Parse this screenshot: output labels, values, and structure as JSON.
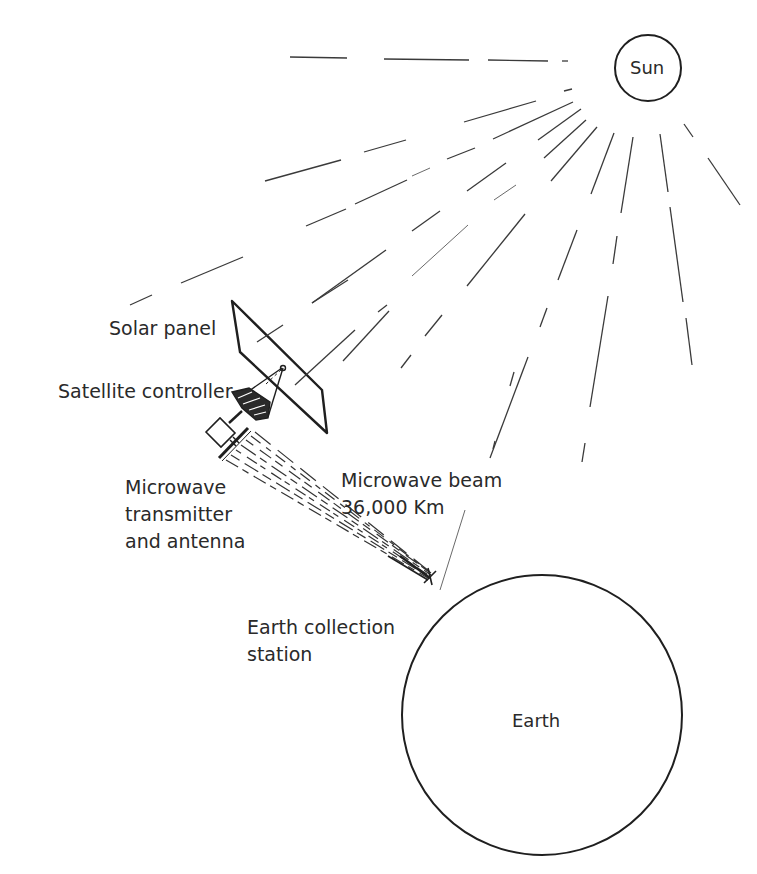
{
  "diagram": {
    "labels": {
      "sun": "Sun",
      "solar_panel": "Solar panel",
      "satellite_controller": "Satellite controller",
      "transmitter_line1": "Microwave",
      "transmitter_line2": "transmitter",
      "transmitter_line3": "and antenna",
      "beam_line1": "Microwave beam",
      "beam_line2": "36,000 Km",
      "station_line1": "Earth collection",
      "station_line2": "station",
      "earth": "Earth"
    },
    "colors": {
      "line": "#1f1f1f",
      "text": "#2a2a2a",
      "background": "#ffffff"
    },
    "beam_distance": "36,000 Km"
  }
}
